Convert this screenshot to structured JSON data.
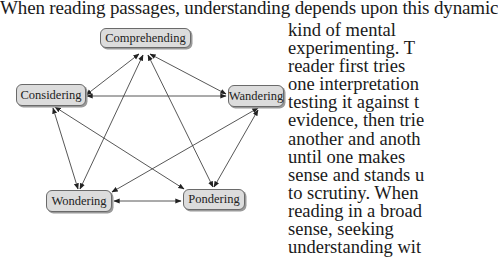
{
  "intro_text": "When reading passages, understanding depends upon this dynamic",
  "side_text_lines": [
    "kind of mental",
    "experimenting.  T",
    "reader first tries",
    "one interpretation",
    "testing it against t",
    "evidence, then trie",
    "another and anoth",
    "until one makes",
    "sense and stands u",
    "to scrutiny.  When",
    "reading in a broad",
    "sense, seeking",
    "understanding wit"
  ],
  "diagram": {
    "nodes": {
      "comprehending": "Comprehending",
      "considering": "Considering",
      "wandering": "Wandering",
      "wondering": "Wondering",
      "pondering": "Pondering"
    },
    "edges": [
      {
        "from": "Comprehending",
        "to": "Considering",
        "bidirectional": true
      },
      {
        "from": "Comprehending",
        "to": "Wandering",
        "bidirectional": true
      },
      {
        "from": "Comprehending",
        "to": "Wondering",
        "bidirectional": true
      },
      {
        "from": "Comprehending",
        "to": "Pondering",
        "bidirectional": true
      },
      {
        "from": "Considering",
        "to": "Wandering",
        "bidirectional": true
      },
      {
        "from": "Considering",
        "to": "Wondering",
        "bidirectional": true
      },
      {
        "from": "Considering",
        "to": "Pondering",
        "bidirectional": true
      },
      {
        "from": "Wandering",
        "to": "Wondering",
        "bidirectional": true
      },
      {
        "from": "Wandering",
        "to": "Pondering",
        "bidirectional": true
      },
      {
        "from": "Wondering",
        "to": "Pondering",
        "bidirectional": true
      }
    ]
  }
}
